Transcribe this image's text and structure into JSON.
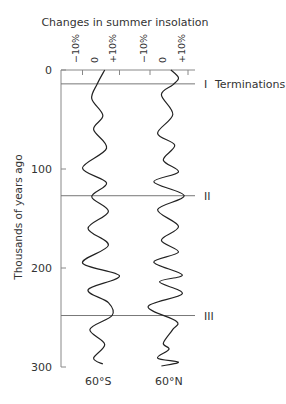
{
  "chart_data": {
    "type": "line",
    "title": "Changes in summer insolation",
    "ylabel": "Thousands of years ago",
    "ylim": [
      0,
      300
    ],
    "y_inverted": true,
    "y_ticks": [
      "0",
      "100",
      "200",
      "300"
    ],
    "x_tick_labels": [
      "−10%",
      "0",
      "+10%"
    ],
    "panels": [
      {
        "name": "60°S",
        "xlabel": "60°S",
        "xlim_pct": [
          -10,
          10
        ],
        "points": [
          [
            0,
            2
          ],
          [
            14,
            -2
          ],
          [
            29,
            -5
          ],
          [
            46,
            1
          ],
          [
            60,
            -4
          ],
          [
            79,
            3
          ],
          [
            99,
            -10
          ],
          [
            114,
            3
          ],
          [
            128,
            -5
          ],
          [
            143,
            4
          ],
          [
            160,
            -7
          ],
          [
            177,
            4
          ],
          [
            195,
            -10
          ],
          [
            208,
            10
          ],
          [
            222,
            -7
          ],
          [
            235,
            4
          ],
          [
            248,
            6
          ],
          [
            262,
            -6
          ],
          [
            277,
            2
          ],
          [
            291,
            -4
          ],
          [
            297,
            1
          ]
        ]
      },
      {
        "name": "60°N",
        "xlabel": "60°N",
        "xlim_pct": [
          -10,
          10
        ],
        "points": [
          [
            0,
            1
          ],
          [
            8,
            5
          ],
          [
            15,
            2
          ],
          [
            25,
            -4
          ],
          [
            45,
            2
          ],
          [
            64,
            -6
          ],
          [
            76,
            3
          ],
          [
            91,
            -3
          ],
          [
            103,
            5
          ],
          [
            113,
            -8
          ],
          [
            127,
            8
          ],
          [
            141,
            -6
          ],
          [
            158,
            5
          ],
          [
            172,
            -4
          ],
          [
            184,
            5
          ],
          [
            194,
            -8
          ],
          [
            207,
            7
          ],
          [
            214,
            -5
          ],
          [
            226,
            7
          ],
          [
            239,
            -11
          ],
          [
            254,
            4
          ],
          [
            262,
            2
          ],
          [
            276,
            -3
          ],
          [
            282,
            0
          ],
          [
            291,
            -6
          ],
          [
            295,
            5
          ],
          [
            299,
            -4
          ]
        ]
      }
    ],
    "annotations": [
      {
        "label": "I",
        "kyr": 14
      },
      {
        "label": "II",
        "kyr": 127
      },
      {
        "label": "III",
        "kyr": 248
      }
    ],
    "annotation_title": "Terminations",
    "grid": false,
    "legend": "none"
  }
}
